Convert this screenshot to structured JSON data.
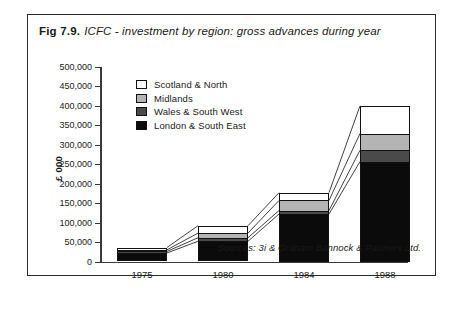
{
  "figure": {
    "number": "Fig 7.9.",
    "title": "ICFC - investment by region: gross advances during year",
    "source_note": "Sources: 3i & Graham Bannock & Partners  Ltd."
  },
  "legend": {
    "items": [
      {
        "label": "Scotland & North",
        "key": "scotland",
        "color": "#ffffff"
      },
      {
        "label": "Midlands",
        "key": "midlands",
        "color": "#b4b4b4"
      },
      {
        "label": "Wales & South West",
        "key": "wales",
        "color": "#4a4a4a"
      },
      {
        "label": "London & South East",
        "key": "london",
        "color": "#0b0b0b"
      }
    ]
  },
  "axis": {
    "y_title": "£ 000",
    "y_ticks": [
      "500,000",
      "450,000",
      "400,000",
      "350,000",
      "300,000",
      "250,000",
      "200,000",
      "150,000",
      "100,000",
      "50,000",
      "0"
    ],
    "x_ticks": [
      "1975",
      "1980",
      "1984",
      "1988"
    ]
  },
  "chart_data": {
    "type": "bar",
    "subtype": "stacked",
    "title": "ICFC - investment by region: gross advances during year",
    "xlabel": "",
    "ylabel": "£ 000",
    "ylim": [
      0,
      500000
    ],
    "ytick_step": 50000,
    "grid": false,
    "legend_position": "top-left inside plot",
    "categories": [
      "1975",
      "1980",
      "1984",
      "1988"
    ],
    "series": [
      {
        "name": "London & South East",
        "color": "#0b0b0b",
        "values": [
          22000,
          52000,
          122000,
          257000
        ]
      },
      {
        "name": "Wales & South West",
        "color": "#4a4a4a",
        "values": [
          4000,
          9000,
          9000,
          29000
        ]
      },
      {
        "name": "Midlands",
        "color": "#b4b4b4",
        "values": [
          4000,
          12000,
          26000,
          43000
        ]
      },
      {
        "name": "Scotland & North",
        "color": "#ffffff",
        "values": [
          6000,
          19000,
          20000,
          71000
        ]
      }
    ],
    "totals": [
      36000,
      92000,
      177000,
      400000
    ],
    "annotations": [
      "Sources: 3i & Graham Bannock & Partners  Ltd."
    ]
  }
}
